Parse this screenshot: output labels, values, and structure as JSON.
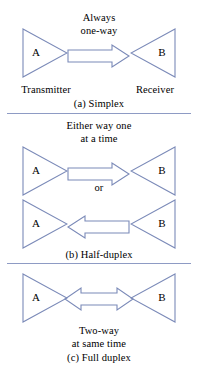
{
  "figure": {
    "line_color": "#7b8ab8",
    "text_color": "#000000",
    "divider_color": "#8e9bc4",
    "background": "#ffffff"
  },
  "sections": [
    {
      "id": "simplex",
      "caption": "(a) Simplex",
      "note_lines": [
        "Always",
        "one-way"
      ],
      "left_node": {
        "letter": "A",
        "label": "Transmitter",
        "direction": "right"
      },
      "right_node": {
        "letter": "B",
        "label": "Receiver",
        "direction": "left"
      },
      "arrows": [
        {
          "direction": "right",
          "name": "arrow-right"
        }
      ]
    },
    {
      "id": "half-duplex",
      "caption": "(b) Half-duplex",
      "note_lines": [
        "Either way one",
        "at a time"
      ],
      "connector": "or",
      "left_node": {
        "letter": "A",
        "label": "",
        "direction": "right"
      },
      "right_node": {
        "letter": "B",
        "label": "",
        "direction": "left"
      },
      "arrows": [
        {
          "direction": "right",
          "name": "arrow-right"
        },
        {
          "direction": "left",
          "name": "arrow-left"
        }
      ]
    },
    {
      "id": "full-duplex",
      "caption": "(c) Full duplex",
      "note_lines": [
        "Two-way",
        "at same time"
      ],
      "left_node": {
        "letter": "A",
        "label": "",
        "direction": "right"
      },
      "right_node": {
        "letter": "B",
        "label": "",
        "direction": "left"
      },
      "arrows": [
        {
          "direction": "both",
          "name": "arrow-double"
        }
      ]
    }
  ]
}
